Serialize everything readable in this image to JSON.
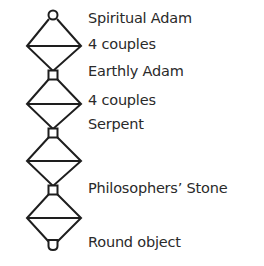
{
  "diagram": {
    "type": "vertical chain of diamonds with nodes",
    "stroke_color": "#1e1e1e",
    "text_color": "#2a2a2a",
    "nodes": [
      {
        "id": "n0",
        "shape": "circle",
        "x": 53,
        "y": 16
      },
      {
        "id": "n1",
        "shape": "square",
        "x": 53,
        "y": 75
      },
      {
        "id": "n2",
        "shape": "square",
        "x": 53,
        "y": 133
      },
      {
        "id": "n3",
        "shape": "square",
        "x": 53,
        "y": 190
      },
      {
        "id": "n4",
        "shape": "cup",
        "x": 53,
        "y": 245
      }
    ],
    "diamonds": [
      {
        "top": 19,
        "mid": 46,
        "bottom": 71,
        "left": 27,
        "right": 81
      },
      {
        "top": 79,
        "mid": 104,
        "bottom": 129,
        "left": 27,
        "right": 81
      },
      {
        "top": 137,
        "mid": 161,
        "bottom": 186,
        "left": 27,
        "right": 81
      },
      {
        "top": 194,
        "mid": 218,
        "bottom": 242,
        "left": 27,
        "right": 81
      }
    ],
    "labels": [
      {
        "text": "Spiritual Adam",
        "top": 11
      },
      {
        "text": "4 couples",
        "top": 37
      },
      {
        "text": "Earthly Adam",
        "top": 64
      },
      {
        "text": "4 couples",
        "top": 93
      },
      {
        "text": "Serpent",
        "top": 117
      },
      {
        "text": "Philosophers’ Stone",
        "top": 181
      },
      {
        "text": "Round object",
        "top": 235
      }
    ]
  }
}
